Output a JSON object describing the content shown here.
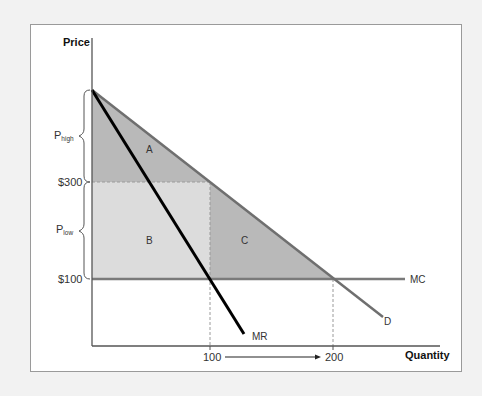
{
  "diagram": {
    "y_axis_label": "Price",
    "x_axis_label": "Quantity",
    "price_labels": {
      "p300": "$300",
      "p100": "$100"
    },
    "brace_labels": {
      "high_main": "P",
      "high_sub": "high",
      "low_main": "P",
      "low_sub": "low"
    },
    "quantity_labels": {
      "q100": "100",
      "q200": "200"
    },
    "curve_labels": {
      "demand": "D",
      "marginal_revenue": "MR",
      "marginal_cost": "MC"
    },
    "area_labels": {
      "a": "A",
      "b": "B",
      "c": "C"
    },
    "colors": {
      "page_background": "#f2f2f2",
      "frame_background": "#ffffff",
      "frame_border": "#9a9a9a",
      "area_dark": "#b9b9b9",
      "area_light": "#dcdcdc",
      "demand_line": "#6f6f6f",
      "mc_line": "#7a7a7a",
      "mr_line": "#000000",
      "axis": "#555555"
    },
    "values": {
      "price_intercept": "above $300 (P_high range top)",
      "price_high": 300,
      "price_low": 100,
      "quantity_monopoly": 100,
      "quantity_competitive": 200
    }
  }
}
